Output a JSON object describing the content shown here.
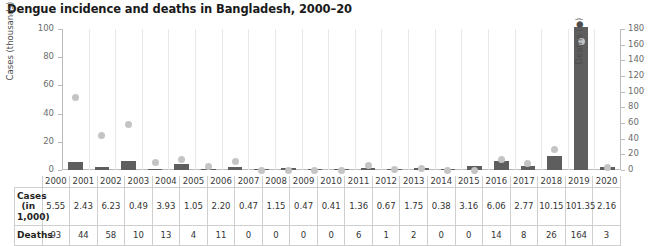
{
  "chart_data": {
    "type": "bar",
    "title": "Dengue incidence and deaths in Bangladesh, 2000–20",
    "xlabel": "",
    "ylabel": "Cases (thousands)",
    "y2label": "Deaths (●)",
    "ylim": [
      0,
      100
    ],
    "y2lim": [
      0,
      180
    ],
    "yticks": [
      "0",
      "20",
      "40",
      "60",
      "80",
      "100"
    ],
    "y2ticks": [
      "0",
      "20",
      "40",
      "60",
      "80",
      "100",
      "120",
      "140",
      "160",
      "180"
    ],
    "grid": false,
    "legend": "none",
    "categories": [
      "2000",
      "2001",
      "2002",
      "2003",
      "2004",
      "2005",
      "2006",
      "2007",
      "2008",
      "2009",
      "2010",
      "2011",
      "2012",
      "2013",
      "2014",
      "2015",
      "2016",
      "2017",
      "2018",
      "2019",
      "2020"
    ],
    "series": [
      {
        "name": "Cases (in 1,000)",
        "type": "bar",
        "axis": "left",
        "color": "#5e5e5e",
        "values": [
          5.55,
          2.43,
          6.23,
          0.49,
          3.93,
          1.05,
          2.2,
          0.47,
          1.15,
          0.47,
          0.41,
          1.36,
          0.67,
          1.75,
          0.38,
          3.16,
          6.06,
          2.77,
          10.15,
          101.35,
          2.16
        ]
      },
      {
        "name": "Deaths",
        "type": "scatter",
        "axis": "right",
        "color": "#c4c4c4",
        "values": [
          93,
          44,
          58,
          10,
          13,
          4,
          11,
          0,
          0,
          0,
          0,
          6,
          1,
          2,
          0,
          0,
          14,
          8,
          26,
          164,
          3
        ]
      }
    ]
  },
  "table": {
    "row_headers": [
      "Cases\n(in 1,000)",
      "Deaths"
    ],
    "cases_label_line1": "Cases",
    "cases_label_line2": "(in 1,000)",
    "deaths_label": "Deaths",
    "years": [
      "2000",
      "2001",
      "2002",
      "2003",
      "2004",
      "2005",
      "2006",
      "2007",
      "2008",
      "2009",
      "2010",
      "2011",
      "2012",
      "2013",
      "2014",
      "2015",
      "2016",
      "2017",
      "2018",
      "2019",
      "2020"
    ],
    "cases": [
      "5.55",
      "2.43",
      "6.23",
      "0.49",
      "3.93",
      "1.05",
      "2.20",
      "0.47",
      "1.15",
      "0.47",
      "0.41",
      "1.36",
      "0.67",
      "1.75",
      "0.38",
      "3.16",
      "6.06",
      "2.77",
      "10.15",
      "101.35",
      "2.16"
    ],
    "deaths": [
      "93",
      "44",
      "58",
      "10",
      "13",
      "4",
      "11",
      "0",
      "0",
      "0",
      "0",
      "6",
      "1",
      "2",
      "0",
      "0",
      "14",
      "8",
      "26",
      "164",
      "3"
    ]
  },
  "colors": {
    "bar": "#5e5e5e",
    "dot": "#c4c4c4",
    "axis": "#bcbcbc",
    "grid": "#e8e8e8",
    "table_border": "#cfcfcf",
    "text": "#231f20"
  }
}
